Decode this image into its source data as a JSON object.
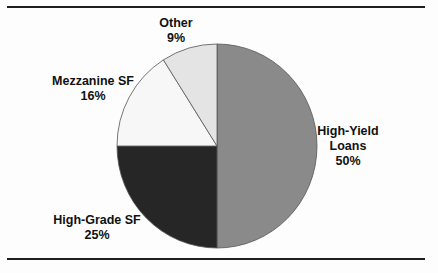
{
  "chart_data": {
    "type": "pie",
    "title": "",
    "slices": [
      {
        "label": "High-Yield Loans",
        "value": 50,
        "display": "50%",
        "color": "#8a8a8a"
      },
      {
        "label": "High-Grade SF",
        "value": 25,
        "display": "25%",
        "color": "#262626"
      },
      {
        "label": "Mezzanine SF",
        "value": 16,
        "display": "16%",
        "color": "#f7f7f7"
      },
      {
        "label": "Other",
        "value": 9,
        "display": "9%",
        "color": "#e4e4e4"
      }
    ],
    "start_angle_deg": 0,
    "direction": "clockwise",
    "legend": "none (data labels beside slices)"
  },
  "labels": {
    "high_yield": {
      "line1": "High-Yield",
      "line2": "Loans",
      "pct": "50%"
    },
    "high_grade": {
      "line1": "High-Grade SF",
      "pct": "25%"
    },
    "mezzanine": {
      "line1": "Mezzanine SF",
      "pct": "16%"
    },
    "other": {
      "line1": "Other",
      "pct": "9%"
    }
  },
  "style": {
    "slice_stroke": "#555555",
    "rule_color": "#1e1e1e"
  }
}
